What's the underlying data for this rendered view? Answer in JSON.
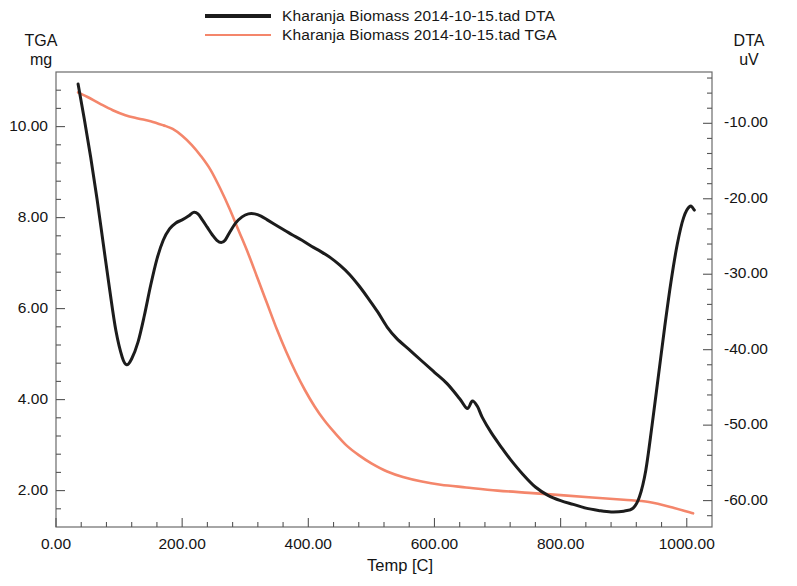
{
  "legend": {
    "entries": [
      {
        "label": "Kharanja Biomass 2014-10-15.tad DTA",
        "color": "#1c1c1c",
        "series": "DTA"
      },
      {
        "label": "Kharanja Biomass 2014-10-15.tad TGA",
        "color": "#f4866b",
        "series": "TGA"
      }
    ]
  },
  "axes": {
    "left_title_line1": "TGA",
    "left_title_line2": "mg",
    "right_title_line1": "DTA",
    "right_title_line2": "uV",
    "x_title": "Temp  [C]"
  },
  "chart_data": {
    "type": "line",
    "title": "",
    "subtitle": "",
    "xlabel": "Temp  [C]",
    "ylabel": "TGA mg",
    "y2label": "DTA uV",
    "grid": false,
    "legend_position": "top-center",
    "xlim": [
      0,
      1040
    ],
    "ylim": [
      1.2,
      11.2
    ],
    "y2lim": [
      -63.5,
      -3.2
    ],
    "xticks": [
      "0.00",
      "200.00",
      "400.00",
      "600.00",
      "800.00",
      "1000.00"
    ],
    "xtick_values": [
      0,
      200,
      400,
      600,
      800,
      1000
    ],
    "yticks": [
      "2.00",
      "4.00",
      "6.00",
      "8.00",
      "10.00"
    ],
    "ytick_values": [
      2,
      4,
      6,
      8,
      10
    ],
    "y2ticks": [
      "-10.00",
      "-20.00",
      "-30.00",
      "-40.00",
      "-50.00",
      "-60.00"
    ],
    "y2tick_values": [
      -10,
      -20,
      -30,
      -40,
      -50,
      -60
    ],
    "minor_ticks_per_interval": 4,
    "series": [
      {
        "name": "Kharanja Biomass 2014-10-15.tad TGA",
        "axis": "left",
        "units": "mg",
        "color": "#f4866b",
        "x": [
          35,
          50,
          70,
          90,
          110,
          130,
          150,
          170,
          185,
          200,
          215,
          230,
          245,
          260,
          275,
          290,
          305,
          320,
          335,
          350,
          365,
          380,
          395,
          410,
          425,
          440,
          460,
          480,
          500,
          525,
          550,
          580,
          610,
          650,
          700,
          750,
          800,
          850,
          900,
          940,
          980,
          1010
        ],
        "y": [
          10.75,
          10.65,
          10.5,
          10.36,
          10.25,
          10.18,
          10.12,
          10.03,
          9.95,
          9.8,
          9.6,
          9.35,
          9.05,
          8.65,
          8.2,
          7.7,
          7.2,
          6.65,
          6.1,
          5.55,
          5.05,
          4.6,
          4.2,
          3.85,
          3.55,
          3.3,
          3.0,
          2.78,
          2.6,
          2.42,
          2.3,
          2.2,
          2.13,
          2.07,
          2.0,
          1.95,
          1.9,
          1.85,
          1.8,
          1.75,
          1.62,
          1.5
        ]
      },
      {
        "name": "Kharanja Biomass 2014-10-15.tad DTA",
        "axis": "right",
        "units": "uV",
        "color": "#1c1c1c",
        "x": [
          35,
          45,
          55,
          65,
          75,
          85,
          95,
          105,
          112,
          120,
          130,
          140,
          150,
          160,
          170,
          180,
          190,
          200,
          210,
          218,
          225,
          232,
          240,
          248,
          255,
          262,
          268,
          275,
          285,
          295,
          305,
          315,
          325,
          335,
          345,
          355,
          365,
          375,
          390,
          405,
          420,
          435,
          450,
          465,
          480,
          495,
          510,
          525,
          540,
          560,
          580,
          600,
          620,
          640,
          652,
          660,
          668,
          676,
          690,
          705,
          720,
          740,
          760,
          780,
          800,
          820,
          840,
          860,
          880,
          900,
          915,
          925,
          935,
          945,
          955,
          965,
          975,
          985,
          995,
          1005,
          1012
        ],
        "y": [
          -4.8,
          -9.5,
          -14.5,
          -20.0,
          -26.0,
          -32.0,
          -37.5,
          -41.0,
          -42.0,
          -41.2,
          -39.0,
          -35.5,
          -31.5,
          -28.0,
          -25.5,
          -24.0,
          -23.2,
          -22.8,
          -22.3,
          -21.8,
          -22.0,
          -22.8,
          -23.8,
          -24.8,
          -25.5,
          -25.8,
          -25.5,
          -24.5,
          -23.2,
          -22.4,
          -22.0,
          -22.0,
          -22.3,
          -22.8,
          -23.3,
          -23.8,
          -24.3,
          -24.8,
          -25.5,
          -26.3,
          -27.0,
          -27.8,
          -28.8,
          -30.0,
          -31.5,
          -33.2,
          -35.0,
          -37.0,
          -38.5,
          -40.0,
          -41.5,
          -43.0,
          -44.5,
          -46.5,
          -47.8,
          -46.8,
          -47.5,
          -49.0,
          -51.0,
          -52.8,
          -54.5,
          -56.5,
          -58.2,
          -59.3,
          -60.0,
          -60.5,
          -61.0,
          -61.3,
          -61.5,
          -61.4,
          -61.0,
          -59.5,
          -56.0,
          -50.0,
          -43.5,
          -37.0,
          -31.0,
          -26.0,
          -22.5,
          -21.0,
          -21.5
        ]
      }
    ]
  }
}
